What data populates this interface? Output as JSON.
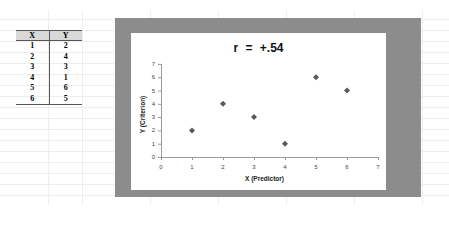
{
  "table": {
    "headers": [
      "X",
      "Y"
    ],
    "rows": [
      [
        "1",
        "2"
      ],
      [
        "2",
        "4"
      ],
      [
        "3",
        "3"
      ],
      [
        "4",
        "1"
      ],
      [
        "5",
        "6"
      ],
      [
        "6",
        "5"
      ]
    ]
  },
  "chart": {
    "title": "r  =  +.54",
    "xlabel": "X (Predictor)",
    "ylabel": "Y (Criterion)"
  },
  "chart_data": {
    "type": "scatter",
    "title": "r = +.54",
    "xlabel": "X (Predictor)",
    "ylabel": "Y (Criterion)",
    "x": [
      1,
      2,
      3,
      4,
      5,
      6
    ],
    "y": [
      2,
      4,
      3,
      1,
      6,
      5
    ],
    "xlim": [
      0,
      7
    ],
    "ylim": [
      0,
      7
    ],
    "xticks": [
      0,
      1,
      2,
      3,
      4,
      5,
      6,
      7
    ],
    "yticks": [
      0,
      1,
      2,
      3,
      4,
      5,
      6,
      7
    ],
    "grid": false,
    "legend": null,
    "marker": "diamond",
    "marker_color": "#595959"
  }
}
